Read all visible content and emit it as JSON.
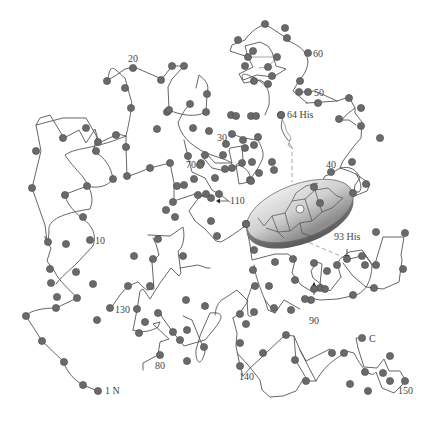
{
  "figure": {
    "colors": {
      "background": "#ffffff",
      "chain": "#555555",
      "residue": "#6a6a6a",
      "heme_fill_light": "#e8e8e8",
      "heme_fill_dark": "#8c8c8c",
      "label": "#444444"
    }
  },
  "labels": {
    "n_terminus": "1 N",
    "c_terminus": "C",
    "res10": "10",
    "res20": "20",
    "res30": "30",
    "res40": "40",
    "res50": "50",
    "res60": "60",
    "his64": "64 His",
    "res70": "70",
    "res80": "80",
    "res90": "90",
    "his93": "93 His",
    "res110": "110",
    "res130": "130",
    "res140": "140",
    "res150": "150"
  },
  "annotations": {
    "distal_histidine": "64 His",
    "proximal_histidine": "93 His",
    "prosthetic_group": "heme"
  }
}
